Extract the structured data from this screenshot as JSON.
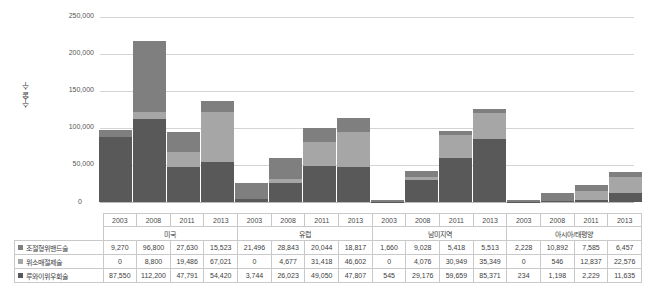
{
  "chart_data": {
    "type": "bar",
    "stacked": true,
    "title": "",
    "xlabel": "",
    "ylabel": "수술 수",
    "ylim": [
      0,
      250000
    ],
    "ytick_labels": [
      "0",
      "50,000",
      "100,000",
      "150,000",
      "200,000",
      "250,000"
    ],
    "ytick_values": [
      0,
      50000,
      100000,
      150000,
      200000,
      250000
    ],
    "grid": true,
    "legend_position": "table-row-labels",
    "groups": [
      "미국",
      "유럽",
      "남미지역",
      "아시아/태평양"
    ],
    "categories": [
      "2003",
      "2008",
      "2011",
      "2013",
      "2003",
      "2008",
      "2011",
      "2013",
      "2003",
      "2008",
      "2011",
      "2013",
      "2003",
      "2008",
      "2011",
      "2013"
    ],
    "series": [
      {
        "name": "조절형위밴드술",
        "color": "#7f7f7f",
        "values": [
          9270,
          96800,
          27630,
          15523,
          21496,
          28843,
          20044,
          18817,
          1660,
          9028,
          5418,
          5513,
          2228,
          10892,
          7585,
          6457
        ]
      },
      {
        "name": "위소매절제술",
        "color": "#a6a6a6",
        "values": [
          0,
          8800,
          19486,
          67021,
          0,
          4677,
          31418,
          46602,
          0,
          4076,
          30949,
          35349,
          0,
          546,
          12837,
          22576
        ]
      },
      {
        "name": "루와이위우회술",
        "color": "#595959",
        "values": [
          87550,
          112200,
          47791,
          54420,
          3744,
          26023,
          49050,
          47807,
          545,
          29176,
          59659,
          85371,
          234,
          1198,
          2229,
          11635
        ]
      }
    ],
    "stack_order_bottom_to_top": [
      "루와이위우회술",
      "위소매절제술",
      "조절형위밴드술"
    ]
  },
  "table": {
    "row_labels": [
      "조절형위밴드술",
      "위소매절제술",
      "루와이위우회술"
    ],
    "swatch_names": [
      "band-swatch",
      "sleeve-swatch",
      "bypass-swatch"
    ],
    "year_headers": [
      "2003",
      "2008",
      "2011",
      "2013",
      "2003",
      "2008",
      "2011",
      "2013",
      "2003",
      "2008",
      "2011",
      "2013",
      "2003",
      "2008",
      "2011",
      "2013"
    ],
    "region_headers": [
      "미국",
      "유럽",
      "남미지역",
      "아시아/태평양"
    ],
    "rows": [
      [
        "9,270",
        "96,800",
        "27,630",
        "15,523",
        "21,496",
        "28,843",
        "20,044",
        "18,817",
        "1,660",
        "9,028",
        "5,418",
        "5,513",
        "2,228",
        "10,892",
        "7,585",
        "6,457"
      ],
      [
        "0",
        "8,800",
        "19,486",
        "67,021",
        "0",
        "4,677",
        "31,418",
        "46,602",
        "0",
        "4,076",
        "30,949",
        "35,349",
        "0",
        "546",
        "12,837",
        "22,576"
      ],
      [
        "87,550",
        "112,200",
        "47,791",
        "54,420",
        "3,744",
        "26,023",
        "49,050",
        "47,807",
        "545",
        "29,176",
        "59,659",
        "85,371",
        "234",
        "1,198",
        "2,229",
        "11,635"
      ]
    ]
  },
  "colors": {
    "band": "#7f7f7f",
    "sleeve": "#a6a6a6",
    "bypass": "#595959",
    "grid": "#d4d4d4",
    "text": "#404040",
    "background": "#ffffff"
  }
}
